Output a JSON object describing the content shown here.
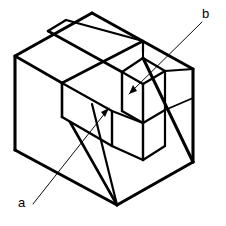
{
  "figure": {
    "kind": "isometric-technical-drawing",
    "title": "",
    "background_color": "#ffffff",
    "line_color": "#000000",
    "labels": [
      {
        "id": "a",
        "text": "a",
        "x": 23,
        "y": 207
      },
      {
        "id": "b",
        "text": "b",
        "x": 207,
        "y": 18
      }
    ],
    "leaders": [
      {
        "id": "leader-a",
        "from_label": "a",
        "points": "32,205 108,107",
        "arrow_at": "108,107",
        "arrow_angle": -52
      },
      {
        "id": "leader-b",
        "from_label": "b",
        "points": "203,21 128,93",
        "arrow_at": "128,93",
        "arrow_angle": 136
      }
    ],
    "outline": {
      "name": "block-silhouette",
      "points": "92,13 15,56 15,150 117,205 193,162 193,69"
    },
    "geometry": {
      "top_face": "92,13 15,56 62,83 142,40",
      "vee_groove_top": "48,30 118,70 142,40 66,20",
      "vee_groove_inner": "51,26 124,66",
      "front_left_face": "15,56 15,150 62,117 62,83",
      "front_bevel": "62,83 62,117 112,145 112,110",
      "front_lower_face": "15,150 117,205 112,145 62,117",
      "right_face": "142,40 142,120 193,162 193,69",
      "right_upper_edge": "92,13 193,69",
      "right_vertical": "193,69 193,162",
      "slot_top_rim": "118,70 142,83 163,70 140,57",
      "slot_left_wall": "118,70 118,110 140,123 140,83",
      "slot_right_wall": "140,83 163,70 163,108 140,123",
      "slot_bottom": "118,110 140,123 163,108",
      "center_post": "112,110 140,123 140,158 112,145",
      "lower_right_edge": "117,205 193,162",
      "inner_diag_1": "142,40 142,120",
      "inner_diag_2": "112,110 142,120",
      "inner_diag_3": "140,158 163,145 163,108",
      "inner_diag_4": "112,145 140,158"
    },
    "stroke_widths": {
      "outline": 3.1,
      "major": 2.6,
      "minor": 1.9,
      "leader": 0.9
    }
  }
}
